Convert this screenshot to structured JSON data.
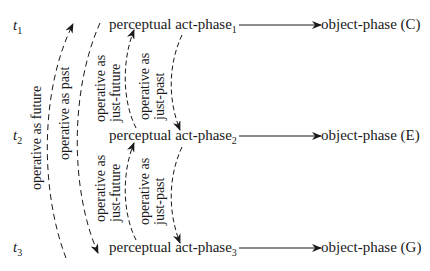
{
  "diagram": {
    "time_labels": [
      {
        "base": "t",
        "sub": "1"
      },
      {
        "base": "t",
        "sub": "2"
      },
      {
        "base": "t",
        "sub": "3"
      }
    ],
    "act_phases": [
      {
        "text": "perceptual act-phase",
        "sub": "1"
      },
      {
        "text": "perceptual act-phase",
        "sub": "2"
      },
      {
        "text": "perceptual act-phase",
        "sub": "3"
      }
    ],
    "object_phases": [
      {
        "text": "object-phase (C)"
      },
      {
        "text": "object-phase (E)"
      },
      {
        "text": "object-phase (G)"
      }
    ],
    "arrow_labels": {
      "outer_future": "operative as future",
      "outer_past": "operative as past",
      "inner_future_1_line1": "operative as",
      "inner_future_1_line2": "just-future",
      "inner_past_1_line1": "operative as",
      "inner_past_1_line2": "just-past",
      "inner_future_2_line1": "operative as",
      "inner_future_2_line2": "just-future",
      "inner_past_2_line1": "operative as",
      "inner_past_2_line2": "just-past"
    },
    "colors": {
      "ink": "#1a1a1a",
      "background": "#ffffff"
    }
  }
}
